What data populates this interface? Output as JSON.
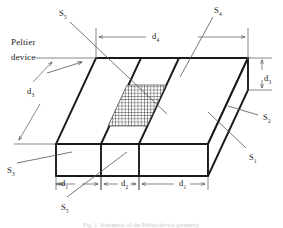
{
  "figure": {
    "device_label_line1": "Peltier",
    "device_label_line2": "device",
    "caption": "Fig. 1.  Schematic of the Peltier device geometry.",
    "colors": {
      "stroke": "#1a1a1a",
      "thin_stroke": "#555555",
      "hatch": "#2b2b2b",
      "background": "#ffffff",
      "caption": "#c9c9c9"
    }
  },
  "surfaces": [
    {
      "id": "S1",
      "base": "S",
      "sub": "1",
      "x": 249,
      "y": 153
    },
    {
      "id": "S2",
      "base": "S",
      "sub": "2",
      "x": 263,
      "y": 113
    },
    {
      "id": "S3",
      "base": "S",
      "sub": "3",
      "x": 7,
      "y": 166
    },
    {
      "id": "S4",
      "base": "S",
      "sub": "4",
      "x": 214,
      "y": 6
    },
    {
      "id": "S5_top",
      "base": "S",
      "sub": "5",
      "x": 59,
      "y": 9
    },
    {
      "id": "S5_bottom",
      "base": "S",
      "sub": "5",
      "x": 61,
      "y": 203
    }
  ],
  "dimensions": [
    {
      "id": "d4",
      "base": "d",
      "sub": "4",
      "x": 152,
      "y": 32,
      "meaning": "total top-face length"
    },
    {
      "id": "d3_left",
      "base": "d",
      "sub": "3",
      "x": 27,
      "y": 87,
      "meaning": "slab depth along oblique axis"
    },
    {
      "id": "d3_right",
      "base": "d",
      "sub": "3",
      "x": 264,
      "y": 74,
      "meaning": "slab thickness at right edge"
    },
    {
      "id": "d1_left",
      "base": "d",
      "sub": "1",
      "x": 61,
      "y": 184,
      "meaning": "left strip width"
    },
    {
      "id": "d2_mid",
      "base": "d",
      "sub": "2",
      "x": 123,
      "y": 184,
      "meaning": "middle strip width"
    },
    {
      "id": "d1_right",
      "base": "d",
      "sub": "1",
      "x": 181,
      "y": 184,
      "meaning": "right strip width"
    }
  ]
}
